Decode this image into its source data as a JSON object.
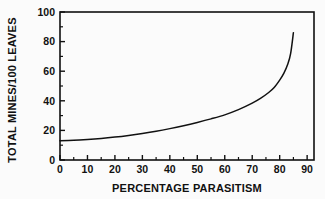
{
  "chart_data": {
    "type": "line",
    "title": "",
    "subtitle": "",
    "xlabel": "PERCENTAGE PARASITISM",
    "ylabel": "TOTAL MINES/100 LEAVES",
    "xlim": [
      0,
      92.5
    ],
    "ylim": [
      0,
      100
    ],
    "xticks": [
      0,
      10,
      20,
      30,
      40,
      50,
      60,
      70,
      80,
      90
    ],
    "yticks": [
      0,
      20,
      40,
      60,
      80,
      100
    ],
    "xtick_labels": [
      "0",
      "10",
      "20",
      "30",
      "40",
      "50",
      "60",
      "70",
      "80",
      "90"
    ],
    "ytick_labels": [
      "0",
      "20",
      "40",
      "60",
      "80",
      "100"
    ],
    "x_minor_tick_interval": 5,
    "y_minor_tick_interval": 10,
    "grid": false,
    "legend": null,
    "legend_position": "none",
    "frame": "box",
    "tick_direction": "in",
    "line_color": "#111111",
    "line_width": 1.5,
    "background_color": "#fbfbfb",
    "series": [
      {
        "name": "total mines per 100 leaves",
        "x": [
          0,
          5,
          10,
          15,
          20,
          25,
          30,
          35,
          40,
          45,
          50,
          55,
          60,
          65,
          70,
          73,
          76,
          78,
          80,
          81.5,
          83,
          84,
          85
        ],
        "values": [
          13.0,
          13.4,
          13.9,
          14.6,
          15.5,
          16.6,
          17.9,
          19.4,
          21.2,
          23.2,
          25.4,
          27.8,
          30.5,
          34.0,
          38.4,
          41.6,
          45.6,
          49.0,
          54.0,
          58.5,
          65.0,
          72.0,
          86.0
        ]
      }
    ],
    "annotations": []
  },
  "labels": {
    "xlabel": "PERCENTAGE PARASITISM",
    "ylabel": "TOTAL MINES/100 LEAVES"
  }
}
